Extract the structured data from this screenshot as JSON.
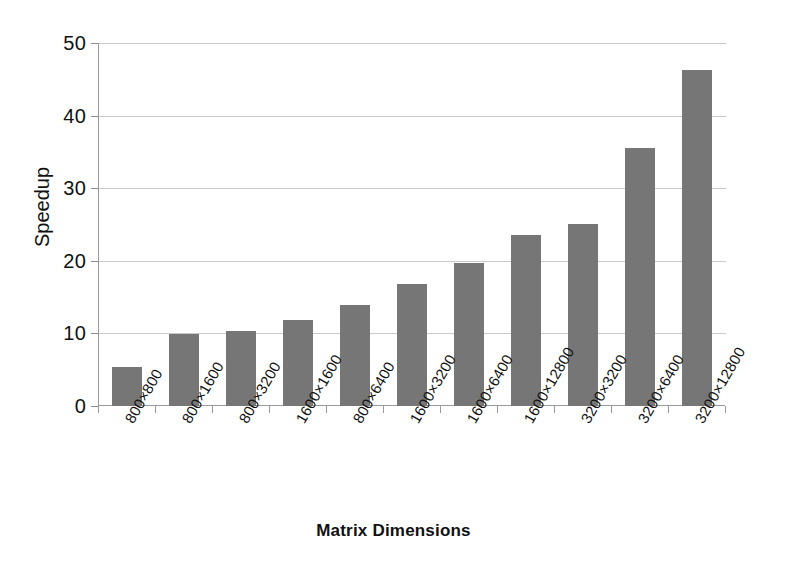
{
  "chart_data": {
    "type": "bar",
    "title": "",
    "xlabel": "Matrix Dimensions",
    "ylabel": "Speedup",
    "categories": [
      "800×800",
      "800×1600",
      "800×3200",
      "1600×1600",
      "800×6400",
      "1600×3200",
      "1600×6400",
      "1600×12800",
      "3200×3200",
      "3200×6400",
      "3200×12800"
    ],
    "values": [
      5.4,
      9.9,
      10.3,
      11.8,
      13.9,
      16.8,
      19.7,
      23.6,
      25.1,
      35.5,
      46.3
    ],
    "ylim": [
      0,
      50
    ],
    "yticks": [
      0,
      10,
      20,
      30,
      40,
      50
    ],
    "ytick_labels": [
      "0",
      "10",
      "20",
      "30",
      "40",
      "50"
    ],
    "grid": true,
    "legend": "none",
    "series_color": "#767676",
    "gridline_color": "#c9c9c9",
    "axis_color": "#9a9a9a"
  }
}
